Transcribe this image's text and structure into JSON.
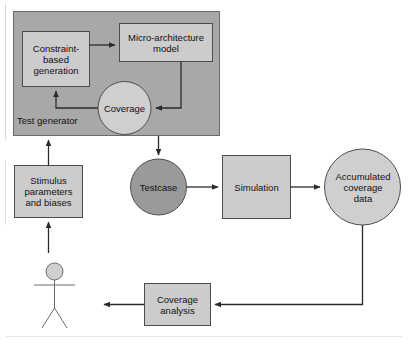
{
  "diagram": {
    "colors": {
      "container_fill": "#a8a8a8",
      "box_fill": "#cccccc",
      "circle_fill": "#cfcfcf",
      "testcase_fill": "#9a9a9a",
      "stroke": "#4d4d4d",
      "dark_stroke": "#2b2b2b",
      "text": "#111111",
      "background": "#ffffff"
    },
    "container": {
      "label": "Test generator",
      "shape": "rectangle"
    },
    "nodes": [
      {
        "id": "constraint-based-generation",
        "label": "Constraint-\nbased\ngeneration",
        "shape": "rectangle"
      },
      {
        "id": "micro-architecture-model",
        "label": "Micro-architecture\nmodel",
        "shape": "rectangle"
      },
      {
        "id": "coverage",
        "label": "Coverage",
        "shape": "circle"
      },
      {
        "id": "stimulus-parameters-and-biases",
        "label": "Stimulus\nparameters\nand biases",
        "shape": "rectangle"
      },
      {
        "id": "testcase",
        "label": "Testcase",
        "shape": "circle"
      },
      {
        "id": "simulation",
        "label": "Simulation",
        "shape": "rectangle"
      },
      {
        "id": "accumulated-coverage-data",
        "label": "Accumulated\ncoverage\ndata",
        "shape": "circle"
      },
      {
        "id": "coverage-analysis",
        "label": "Coverage\nanalysis",
        "shape": "rectangle"
      },
      {
        "id": "user",
        "label": "",
        "shape": "stick-figure"
      }
    ],
    "edges": [
      {
        "from": "constraint-based-generation",
        "to": "micro-architecture-model"
      },
      {
        "from": "micro-architecture-model",
        "to": "coverage"
      },
      {
        "from": "coverage",
        "to": "constraint-based-generation"
      },
      {
        "from": "test-generator",
        "to": "testcase"
      },
      {
        "from": "stimulus-parameters-and-biases",
        "to": "test-generator"
      },
      {
        "from": "user",
        "to": "stimulus-parameters-and-biases"
      },
      {
        "from": "testcase",
        "to": "simulation"
      },
      {
        "from": "simulation",
        "to": "accumulated-coverage-data"
      },
      {
        "from": "accumulated-coverage-data",
        "to": "coverage-analysis"
      },
      {
        "from": "coverage-analysis",
        "to": "user"
      }
    ]
  }
}
